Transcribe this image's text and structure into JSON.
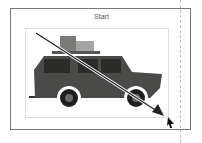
{
  "frame": {
    "label": "Start"
  },
  "colors": {
    "car_body": "#4a4b48",
    "window": "#2b2c2a",
    "luggage1": "#7a7b78",
    "luggage2": "#a4a5a2",
    "arrow": "#222222"
  }
}
